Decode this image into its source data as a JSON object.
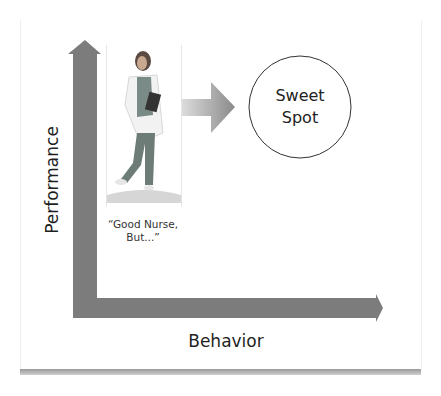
{
  "diagram": {
    "y_axis": {
      "label": "Performance",
      "color": "#7a7a7a"
    },
    "x_axis": {
      "label": "Behavior",
      "color": "#7a7a7a"
    },
    "subject": {
      "image": "nurse-photo",
      "caption_line1": "“Good Nurse,",
      "caption_line2": "But...”"
    },
    "transition_arrow": {
      "direction": "right",
      "gradient_from": "#d8d8d8",
      "gradient_to": "#8c8c8c"
    },
    "target": {
      "line1": "Sweet",
      "line2": "Spot",
      "shape": "circle"
    }
  }
}
